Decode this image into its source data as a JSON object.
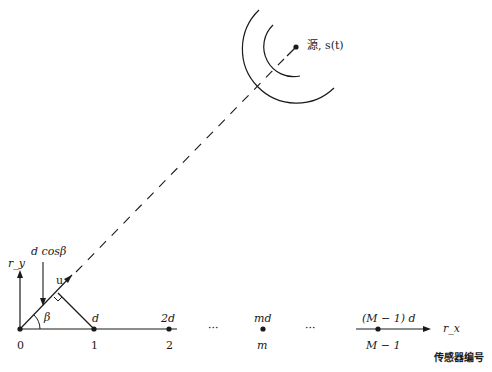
{
  "diagram": {
    "source": {
      "label": "源, s(t)"
    },
    "axes": {
      "x_label": "r_x",
      "y_label": "r_y",
      "x_sub": "x",
      "y_sub": "y"
    },
    "sensors": [
      {
        "index": "0",
        "position": ""
      },
      {
        "index": "1",
        "position": "d"
      },
      {
        "index": "2",
        "position": "2d"
      },
      {
        "index": "m",
        "position": "md"
      },
      {
        "index": "M − 1",
        "position": "(M − 1) d"
      }
    ],
    "ellipsis": "···",
    "angle_label": "β",
    "unit_vector_label": "u",
    "projection_label": "d cosβ",
    "sensor_axis_caption": "传感器编号"
  }
}
